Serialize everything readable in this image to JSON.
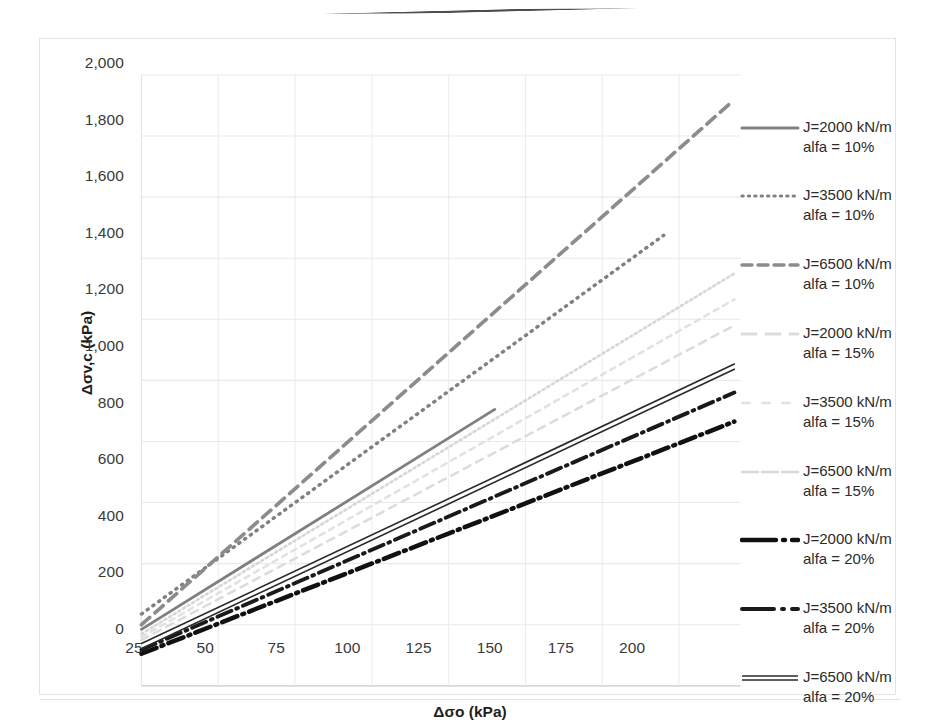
{
  "chart_data": {
    "type": "line",
    "title": "",
    "xlabel": "Δσo (kPa)",
    "ylabel": "Δσv,c (kPa)",
    "xlim": [
      25,
      220
    ],
    "ylim": [
      0,
      2000
    ],
    "xticks": [
      "25",
      "50",
      "75",
      "100",
      "125",
      "150",
      "175",
      "200"
    ],
    "xtick_values": [
      25,
      50,
      75,
      100,
      125,
      150,
      175,
      200
    ],
    "yticks": [
      "0",
      "200",
      "400",
      "600",
      "800",
      "1,000",
      "1,200",
      "1,400",
      "1,600",
      "1,800",
      "2,000"
    ],
    "ytick_values": [
      0,
      200,
      400,
      600,
      800,
      1000,
      1200,
      1400,
      1600,
      1800,
      2000
    ],
    "grid": true,
    "legend_position": "right",
    "series": [
      {
        "name": "J=2000 kN/m\nalfa = 10%",
        "style": "solid",
        "color": "#808080",
        "width": 2.6,
        "x": [
          25,
          140
        ],
        "y": [
          185,
          905
        ]
      },
      {
        "name": "J=3500 kN/m\nalfa = 10%",
        "style": "dotted",
        "color": "#808080",
        "width": 3.2,
        "x": [
          25,
          195
        ],
        "y": [
          235,
          1475
        ]
      },
      {
        "name": "J=6500 kN/m\nalfa = 10%",
        "style": "dashed",
        "color": "#8c8c8c",
        "width": 3.4,
        "x": [
          25,
          217
        ],
        "y": [
          200,
          1910
        ]
      },
      {
        "name": "J=2000 kN/m\nalfa = 15%",
        "style": "faint-dash",
        "color": "#dcdcdc",
        "width": 2.4,
        "x": [
          25,
          218
        ],
        "y": [
          150,
          1180
        ]
      },
      {
        "name": "J=3500 kN/m\nalfa = 15%",
        "style": "faint-dash2",
        "color": "#e2e2e2",
        "width": 2.4,
        "x": [
          25,
          218
        ],
        "y": [
          160,
          1265
        ]
      },
      {
        "name": "J=6500 kN/m\nalfa = 15%",
        "style": "faint-solid",
        "color": "#d6d6d6",
        "width": 2.4,
        "x": [
          25,
          218
        ],
        "y": [
          170,
          1350
        ]
      },
      {
        "name": "J=2000 kN/m\nalfa = 20%",
        "style": "dashdot-thick",
        "color": "#111111",
        "width": 4.2,
        "x": [
          25,
          218
        ],
        "y": [
          105,
          865
        ]
      },
      {
        "name": "J=3500 kN/m\nalfa = 20%",
        "style": "dashdot",
        "color": "#1a1a1a",
        "width": 3.6,
        "x": [
          25,
          218
        ],
        "y": [
          118,
          960
        ]
      },
      {
        "name": "J=6500 kN/m\nalfa = 20%",
        "style": "double",
        "color": "#2a2a2a",
        "width": 3.0,
        "x": [
          25,
          218
        ],
        "y": [
          130,
          1045
        ]
      }
    ]
  },
  "legend": {
    "items": [
      {
        "label": "J=2000 kN/m\nalfa = 10%",
        "key": "solid-gray"
      },
      {
        "label": "J=3500 kN/m\nalfa = 10%",
        "key": "dotted-gray"
      },
      {
        "label": "J=6500 kN/m\nalfa = 10%",
        "key": "dashed-gray"
      },
      {
        "label": "J=2000 kN/m\nalfa = 15%",
        "key": "faint-dash-1"
      },
      {
        "label": "J=3500 kN/m\nalfa = 15%",
        "key": "faint-dash-2"
      },
      {
        "label": "J=6500 kN/m\nalfa = 15%",
        "key": "faint-solid"
      },
      {
        "label": "J=2000 kN/m\nalfa = 20%",
        "key": "dashdot-thick-black"
      },
      {
        "label": "J=3500 kN/m\nalfa = 20%",
        "key": "dashdot-black"
      },
      {
        "label": "J=6500 kN/m\nalfa = 20%",
        "key": "double-black"
      }
    ]
  }
}
